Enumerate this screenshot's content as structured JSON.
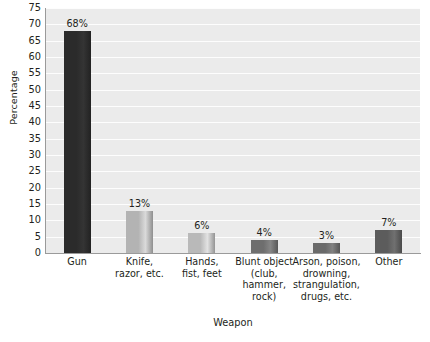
{
  "chart_data": {
    "type": "bar",
    "title": "",
    "xlabel": "Weapon",
    "ylabel": "Percentage",
    "categories": [
      "Gun",
      "Knife,\nrazor, etc.",
      "Hands,\nfist, feet",
      "Blunt object\n(club,\nhammer,\nrock)",
      "Arson, poison,\ndrowning,\nstrangulation,\ndrugs, etc.",
      "Other"
    ],
    "values": [
      68,
      13,
      6,
      4,
      3,
      7
    ],
    "data_labels": [
      "68%",
      "13%",
      "6%",
      "4%",
      "3%",
      "7%"
    ],
    "ylim": [
      0,
      75
    ],
    "ytick_step": 5,
    "ytick_labels": [
      "75",
      "70",
      "65",
      "60",
      "55",
      "50",
      "45",
      "40",
      "35",
      "30",
      "25",
      "20",
      "15",
      "10",
      "5",
      "0"
    ],
    "grid": true,
    "grid_axis": "y",
    "legend": false,
    "bar_colors": [
      "#2b2b2b",
      "#b3b3b3",
      "#b9b9b9",
      "#6e6e6e",
      "#6a6a6a",
      "#5c5c5c"
    ],
    "plot_background": "#ebebeb",
    "gridline_color": "#fdfdfd",
    "axis_color": "#9a9a9a"
  }
}
